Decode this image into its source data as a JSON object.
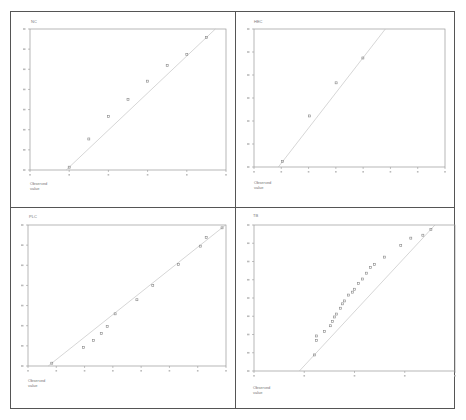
{
  "chart_data": [
    {
      "type": "scatter",
      "title": "NC",
      "subtype": "normal-qq",
      "xlabel": "Observed value",
      "ylabel": "",
      "grid": false,
      "reference_line": true,
      "x_ticks": 6,
      "y_ticks": 8,
      "points_norm": [
        [
          0.2,
          0.02
        ],
        [
          0.3,
          0.22
        ],
        [
          0.4,
          0.38
        ],
        [
          0.5,
          0.5
        ],
        [
          0.6,
          0.63
        ],
        [
          0.7,
          0.74
        ],
        [
          0.8,
          0.82
        ],
        [
          0.9,
          0.94
        ]
      ]
    },
    {
      "type": "scatter",
      "title": "HEC",
      "subtype": "normal-qq",
      "xlabel": "Observed value",
      "ylabel": "",
      "grid": false,
      "reference_line": true,
      "x_ticks": 8,
      "y_ticks": 7,
      "points_norm": [
        [
          0.15,
          0.04
        ],
        [
          0.29,
          0.37
        ],
        [
          0.43,
          0.61
        ],
        [
          0.57,
          0.79
        ]
      ]
    },
    {
      "type": "scatter",
      "title": "PLC",
      "subtype": "normal-qq",
      "xlabel": "Observed value",
      "ylabel": "",
      "grid": false,
      "reference_line": true,
      "x_ticks": 8,
      "y_ticks": 8,
      "points_norm": [
        [
          0.12,
          0.02
        ],
        [
          0.28,
          0.13
        ],
        [
          0.33,
          0.18
        ],
        [
          0.37,
          0.23
        ],
        [
          0.4,
          0.28
        ],
        [
          0.44,
          0.37
        ],
        [
          0.55,
          0.47
        ],
        [
          0.63,
          0.57
        ],
        [
          0.76,
          0.72
        ],
        [
          0.87,
          0.85
        ],
        [
          0.9,
          0.91
        ],
        [
          0.98,
          0.98
        ]
      ]
    },
    {
      "type": "scatter",
      "title": "TB",
      "subtype": "normal-qq",
      "xlabel": "Observed value",
      "ylabel": "",
      "grid": false,
      "reference_line": true,
      "x_ticks": 5,
      "y_ticks": 9,
      "points_norm": [
        [
          0.3,
          0.11
        ],
        [
          0.31,
          0.21
        ],
        [
          0.31,
          0.24
        ],
        [
          0.35,
          0.27
        ],
        [
          0.38,
          0.31
        ],
        [
          0.39,
          0.34
        ],
        [
          0.4,
          0.37
        ],
        [
          0.41,
          0.39
        ],
        [
          0.43,
          0.43
        ],
        [
          0.44,
          0.46
        ],
        [
          0.45,
          0.48
        ],
        [
          0.47,
          0.52
        ],
        [
          0.49,
          0.54
        ],
        [
          0.5,
          0.56
        ],
        [
          0.52,
          0.6
        ],
        [
          0.54,
          0.63
        ],
        [
          0.56,
          0.67
        ],
        [
          0.58,
          0.71
        ],
        [
          0.6,
          0.73
        ],
        [
          0.65,
          0.78
        ],
        [
          0.73,
          0.86
        ],
        [
          0.78,
          0.91
        ],
        [
          0.84,
          0.93
        ],
        [
          0.88,
          0.97
        ]
      ]
    }
  ],
  "panels": [
    {
      "title": "NC",
      "xlabel": "Observed value"
    },
    {
      "title": "HEC",
      "xlabel": "Observed value"
    },
    {
      "title": "PLC",
      "xlabel": "Observed value"
    },
    {
      "title": "TB",
      "xlabel": "Observed value"
    }
  ],
  "colors": {
    "axis": "#999999",
    "point": "#888888",
    "line": "#bbbbbb",
    "frame": "#555555"
  }
}
